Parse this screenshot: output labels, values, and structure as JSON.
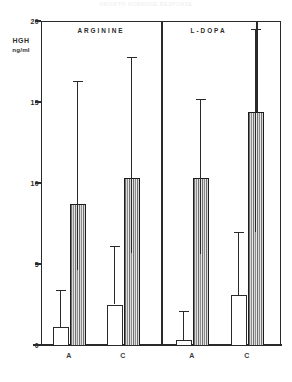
{
  "figure": {
    "scan_title": "GROWTH HORMONE RESPONSE"
  },
  "chart_data": {
    "type": "bar",
    "title": "",
    "xlabel": "",
    "ylabel": "HGH ng/ml",
    "ylabel_line1": "HGH",
    "ylabel_line2": "ng/ml",
    "ylim": [
      0,
      20
    ],
    "yticks": [
      0,
      5,
      10,
      15,
      20
    ],
    "ytick_labels": [
      "0",
      "5",
      "10",
      "15",
      "20"
    ],
    "grid": false,
    "legend": "none",
    "groups": [
      {
        "name": "ARGININE"
      },
      {
        "name": "L-DOPA"
      }
    ],
    "categories": [
      "A",
      "C",
      "A",
      "C"
    ],
    "series": [
      {
        "name": "open",
        "style": "open",
        "values": [
          1.1,
          2.5,
          0.3,
          3.1
        ],
        "err_high": [
          3.4,
          6.1,
          2.1,
          7.0
        ],
        "err_low": [
          0.0,
          0.0,
          0.0,
          0.0
        ]
      },
      {
        "name": "hatched",
        "style": "hatched",
        "values": [
          8.7,
          10.3,
          10.3,
          14.4
        ],
        "err_high": [
          16.3,
          17.8,
          15.2,
          19.5
        ],
        "err_low": [
          4.6,
          5.7,
          5.6,
          7.0
        ]
      }
    ],
    "bars": [
      {
        "group": "ARGININE",
        "category": "A",
        "style": "open",
        "value": 1.1,
        "err_high": 3.4,
        "err_low": 0.0
      },
      {
        "group": "ARGININE",
        "category": "A",
        "style": "hatched",
        "value": 8.7,
        "err_high": 16.3,
        "err_low": 4.6
      },
      {
        "group": "ARGININE",
        "category": "C",
        "style": "open",
        "value": 2.5,
        "err_high": 6.1,
        "err_low": 0.0
      },
      {
        "group": "ARGININE",
        "category": "C",
        "style": "hatched",
        "value": 10.3,
        "err_high": 17.8,
        "err_low": 5.7
      },
      {
        "group": "L-DOPA",
        "category": "A",
        "style": "open",
        "value": 0.3,
        "err_high": 2.1,
        "err_low": 0.0
      },
      {
        "group": "L-DOPA",
        "category": "A",
        "style": "hatched",
        "value": 10.3,
        "err_high": 15.2,
        "err_low": 5.6
      },
      {
        "group": "L-DOPA",
        "category": "C",
        "style": "open",
        "value": 3.1,
        "err_high": 7.0,
        "err_low": 0.0
      },
      {
        "group": "L-DOPA",
        "category": "C",
        "style": "hatched",
        "value": 14.4,
        "err_high": 19.5,
        "err_low": 7.0
      }
    ],
    "colors": {
      "axis": "#2a2a2a",
      "open_fill": "#ffffff",
      "hatch_dark": "#707070",
      "hatch_light": "#e8e8e8",
      "text": "#2a2a2a"
    }
  }
}
